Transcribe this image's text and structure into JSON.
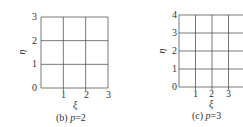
{
  "chart_data": [
    {
      "type": "table",
      "title": "(b) p=2",
      "caption_prefix": "(b)",
      "caption_var": "p",
      "caption_value": "=2",
      "xlabel": "ξ",
      "ylabel": "η",
      "xlim": [
        0,
        3
      ],
      "ylim": [
        0,
        3
      ],
      "x_ticks": [
        "1",
        "2",
        "3"
      ],
      "y_ticks": [
        "0",
        "1",
        "2",
        "3"
      ],
      "grid": true,
      "grid_lines_x": [
        0,
        1,
        2,
        3
      ],
      "grid_lines_y": [
        0,
        1,
        2,
        3
      ]
    },
    {
      "type": "table",
      "title": "(c) p=3",
      "caption_prefix": "(c)",
      "caption_var": "p",
      "caption_value": "=3",
      "xlabel": "ξ",
      "ylabel": "η",
      "xlim": [
        0,
        4
      ],
      "ylim": [
        0,
        4
      ],
      "x_ticks": [
        "1",
        "2",
        "3"
      ],
      "y_ticks": [
        "0",
        "1",
        "2",
        "3",
        "4"
      ],
      "grid": true,
      "grid_lines_x": [
        0,
        1,
        2,
        3,
        4
      ],
      "grid_lines_y": [
        0,
        1,
        2,
        3,
        4
      ]
    }
  ],
  "colors": {
    "grid": "#555555",
    "axis": "#333333",
    "text": "#333333"
  }
}
